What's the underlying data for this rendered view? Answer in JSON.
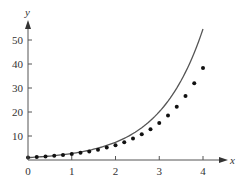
{
  "chart_data": {
    "type": "scatter",
    "title": "",
    "xlabel": "x",
    "ylabel": "y",
    "xlim": [
      0,
      4
    ],
    "ylim": [
      0,
      55
    ],
    "x_ticks": [
      0,
      1,
      2,
      3,
      4
    ],
    "y_ticks": [
      10,
      20,
      30,
      40,
      50
    ],
    "grid": false,
    "legend": null,
    "series": [
      {
        "name": "curve",
        "kind": "line",
        "color": "#555555",
        "x": [
          0,
          0.25,
          0.5,
          0.75,
          1,
          1.25,
          1.5,
          1.75,
          2,
          2.25,
          2.5,
          2.75,
          3,
          3.25,
          3.5,
          3.75,
          4
        ],
        "values": [
          1.0,
          1.28,
          1.65,
          2.12,
          2.72,
          3.49,
          4.48,
          5.75,
          7.39,
          9.49,
          12.18,
          15.64,
          20.09,
          25.79,
          33.12,
          42.52,
          54.6
        ]
      },
      {
        "name": "points",
        "kind": "scatter",
        "color": "#111111",
        "x": [
          0,
          0.2,
          0.4,
          0.6,
          0.8,
          1.0,
          1.2,
          1.4,
          1.6,
          1.8,
          2.0,
          2.2,
          2.4,
          2.6,
          2.8,
          3.0,
          3.2,
          3.4,
          3.6,
          3.8,
          4.0
        ],
        "values": [
          1.0,
          1.2,
          1.44,
          1.73,
          2.07,
          2.49,
          2.99,
          3.58,
          4.3,
          5.16,
          6.19,
          7.43,
          8.92,
          10.7,
          12.84,
          15.41,
          18.49,
          22.19,
          26.62,
          31.95,
          38.34
        ]
      }
    ]
  },
  "axes": {
    "x_label": "x",
    "y_label": "y",
    "x_tick_labels": [
      "0",
      "1",
      "2",
      "3",
      "4"
    ],
    "y_tick_labels": [
      "10",
      "20",
      "30",
      "40",
      "50"
    ]
  }
}
